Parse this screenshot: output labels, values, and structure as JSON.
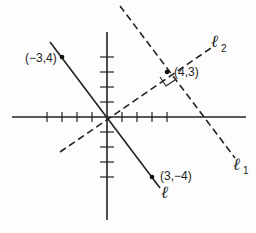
{
  "diagram": {
    "type": "coordinate-geometry",
    "axes": {
      "origin_px": [
        107,
        117
      ],
      "unit_px": 15,
      "x_ticks": [
        -4,
        -3,
        -2,
        -1,
        1,
        2,
        3,
        4
      ],
      "y_ticks": [
        -4,
        -3,
        -2,
        -1,
        1,
        2,
        3,
        4
      ]
    },
    "points": [
      {
        "label": "(−3,4)",
        "x": -3,
        "y": 4
      },
      {
        "label": "(4,3)",
        "x": 4,
        "y": 3
      },
      {
        "label": "(3,−4)",
        "x": 3,
        "y": -4
      }
    ],
    "lines": [
      {
        "name": "ℓ",
        "subscript": "",
        "style": "solid",
        "through": [
          "(-3,4)",
          "(0,0)",
          "(3,-4)"
        ]
      },
      {
        "name": "ℓ",
        "subscript": "2",
        "style": "dashed",
        "through": [
          "(0,0)",
          "(4,3)"
        ]
      },
      {
        "name": "ℓ",
        "subscript": "1",
        "style": "dashed",
        "through": [
          "(4,3)"
        ],
        "parallel_to": "ℓ"
      }
    ],
    "annotations": [
      {
        "type": "right-angle-marker",
        "at": "(4,3)",
        "between": [
          "ℓ₁",
          "ℓ₂"
        ]
      }
    ],
    "colors": {
      "ink": "#222222",
      "background": "#fdfdfd"
    }
  }
}
